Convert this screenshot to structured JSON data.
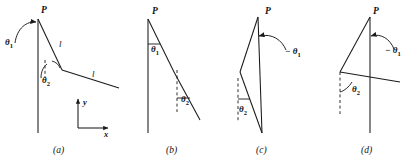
{
  "figure": {
    "type": "line-diagram",
    "stroke_color": "#1a1a1a",
    "background_color": "#ffffff",
    "panels": [
      {
        "id": "a",
        "caption": "(a)",
        "point_label": "P",
        "angle_labels": [
          "θ1",
          "θ2"
        ],
        "length_labels": [
          "l",
          "l"
        ],
        "axes": {
          "x_label": "x",
          "y_label": "y"
        }
      },
      {
        "id": "b",
        "caption": "(b)",
        "point_label": "P",
        "angle_labels": [
          "θ1",
          "θ2"
        ]
      },
      {
        "id": "c",
        "caption": "(c)",
        "point_label": "P",
        "angle_labels": [
          "− θ1",
          "θ2"
        ]
      },
      {
        "id": "d",
        "caption": "(d)",
        "point_label": "P",
        "angle_labels": [
          "− θ1",
          "θ2"
        ]
      }
    ]
  },
  "labels": {
    "P": "P",
    "l": "l",
    "theta1": "θ",
    "theta1_sub": "1",
    "theta2": "θ",
    "theta2_sub": "2",
    "minus_theta1": "− θ",
    "axis_x": "x",
    "axis_y": "y",
    "cap_a": "(a)",
    "cap_b": "(b)",
    "cap_c": "(c)",
    "cap_d": "(d)"
  }
}
